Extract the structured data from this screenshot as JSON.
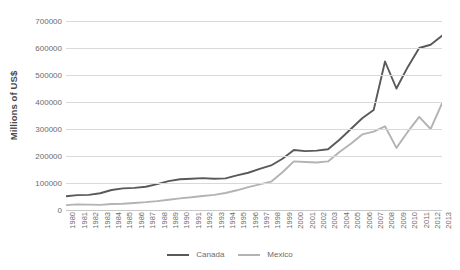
{
  "chart_data": {
    "type": "line",
    "title": "",
    "xlabel": "",
    "ylabel": "Millions of US$",
    "ylim": [
      0,
      700000
    ],
    "ytick_step": 100000,
    "yticks": [
      0,
      100000,
      200000,
      300000,
      400000,
      500000,
      600000,
      700000
    ],
    "ytick_labels": [
      "0",
      "100000",
      "200000",
      "300000",
      "400000",
      "500000",
      "600000",
      "700000"
    ],
    "grid": true,
    "legend_position": "bottom-center",
    "categories": [
      "1980",
      "1981",
      "1982",
      "1983",
      "1984",
      "1985",
      "1986",
      "1987",
      "1988",
      "1989",
      "1990",
      "1991",
      "1992",
      "1993",
      "1994",
      "1995",
      "1996",
      "1997",
      "1998",
      "1999",
      "2000",
      "2001",
      "2002",
      "2003",
      "2004",
      "2005",
      "2006",
      "2007",
      "2008",
      "2009",
      "2010",
      "2011",
      "2012",
      "2013"
    ],
    "series": [
      {
        "name": "Canada",
        "color": "#595959",
        "values": [
          51000,
          55000,
          56000,
          62000,
          74000,
          80000,
          82000,
          86000,
          96000,
          107000,
          114000,
          116000,
          118000,
          116000,
          117000,
          128000,
          138000,
          152000,
          165000,
          190000,
          222000,
          218000,
          220000,
          225000,
          260000,
          300000,
          340000,
          370000,
          550000,
          450000,
          530000,
          600000,
          612000,
          645000
        ]
      },
      {
        "name": "Mexico",
        "color": "#b3b3b3",
        "values": [
          18000,
          21000,
          20000,
          19000,
          22000,
          23000,
          26000,
          29000,
          33000,
          38000,
          43000,
          47000,
          52000,
          56000,
          63000,
          73000,
          85000,
          95000,
          105000,
          140000,
          180000,
          178000,
          176000,
          180000,
          215000,
          245000,
          280000,
          290000,
          310000,
          230000,
          290000,
          345000,
          300000,
          395000
        ]
      }
    ]
  },
  "legend": {
    "items": [
      {
        "label": "Canada",
        "color": "#595959"
      },
      {
        "label": "Mexico",
        "color": "#b3b3b3"
      }
    ]
  }
}
